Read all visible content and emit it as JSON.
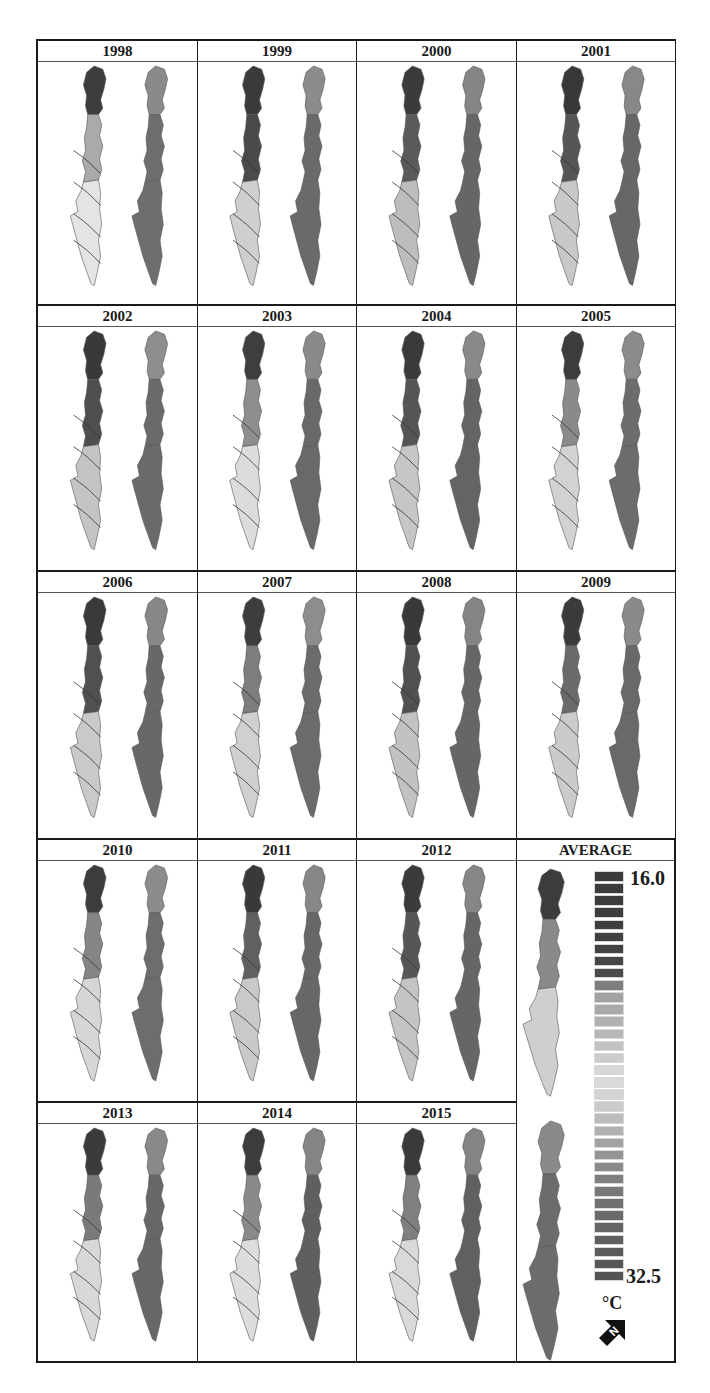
{
  "figure": {
    "panels": [
      {
        "label": "1998",
        "north": "#3d3d3d",
        "mid": "#aaaaaa",
        "south": "#e4e4e4",
        "right": "#6e6e6e",
        "rightTop": "#8a8a8a"
      },
      {
        "label": "1999",
        "north": "#3a3a3a",
        "mid": "#4a4a4a",
        "south": "#cfcfcf",
        "right": "#6a6a6a",
        "rightTop": "#8c8c8c"
      },
      {
        "label": "2000",
        "north": "#3b3b3b",
        "mid": "#5a5a5a",
        "south": "#bdbdbd",
        "right": "#666666",
        "rightTop": "#858585"
      },
      {
        "label": "2001",
        "north": "#383838",
        "mid": "#555555",
        "south": "#c8c8c8",
        "right": "#676767",
        "rightTop": "#888888"
      },
      {
        "label": "2002",
        "north": "#393939",
        "mid": "#4e4e4e",
        "south": "#c4c4c4",
        "right": "#6a6a6a",
        "rightTop": "#8e8e8e"
      },
      {
        "label": "2003",
        "north": "#3e3e3e",
        "mid": "#8e8e8e",
        "south": "#dcdcdc",
        "right": "#696969",
        "rightTop": "#8a8a8a"
      },
      {
        "label": "2004",
        "north": "#3a3a3a",
        "mid": "#555555",
        "south": "#c6c6c6",
        "right": "#646464",
        "rightTop": "#898989"
      },
      {
        "label": "2005",
        "north": "#3c3c3c",
        "mid": "#8a8a8a",
        "south": "#d2d2d2",
        "right": "#6c6c6c",
        "rightTop": "#8b8b8b"
      },
      {
        "label": "2006",
        "north": "#3a3a3a",
        "mid": "#505050",
        "south": "#c9c9c9",
        "right": "#686868",
        "rightTop": "#878787"
      },
      {
        "label": "2007",
        "north": "#3d3d3d",
        "mid": "#7d7d7d",
        "south": "#d0d0d0",
        "right": "#6b6b6b",
        "rightTop": "#8d8d8d"
      },
      {
        "label": "2008",
        "north": "#393939",
        "mid": "#505050",
        "south": "#c2c2c2",
        "right": "#666666",
        "rightTop": "#848484"
      },
      {
        "label": "2009",
        "north": "#3b3b3b",
        "mid": "#6a6a6a",
        "south": "#cbcbcb",
        "right": "#696969",
        "rightTop": "#8a8a8a"
      },
      {
        "label": "2010",
        "north": "#3c3c3c",
        "mid": "#858585",
        "south": "#d6d6d6",
        "right": "#6d6d6d",
        "rightTop": "#8c8c8c"
      },
      {
        "label": "2011",
        "north": "#393939",
        "mid": "#606060",
        "south": "#c9c9c9",
        "right": "#676767",
        "rightTop": "#878787"
      },
      {
        "label": "2012",
        "north": "#3a3a3a",
        "mid": "#565656",
        "south": "#c4c4c4",
        "right": "#666666",
        "rightTop": "#868686"
      },
      {
        "label": "2013",
        "north": "#3b3b3b",
        "mid": "#7a7a7a",
        "south": "#d8d8d8",
        "right": "#676767",
        "rightTop": "#898989"
      },
      {
        "label": "2014",
        "north": "#3c3c3c",
        "mid": "#8a8a8a",
        "south": "#dddddd",
        "right": "#5f5f5f",
        "rightTop": "#858585"
      },
      {
        "label": "2015",
        "north": "#3a3a3a",
        "mid": "#7f7f7f",
        "south": "#d9d9d9",
        "right": "#606060",
        "rightTop": "#848484"
      }
    ],
    "average": {
      "label": "AVERAGE",
      "north": "#3c3c3c",
      "mid": "#8a8a8a",
      "south": "#cfcfcf",
      "right": "#6c6c6c",
      "rightTop": "#8a8a8a"
    },
    "contour_labels": [
      "21",
      "22",
      "23",
      "24",
      "25",
      "26"
    ],
    "legend": {
      "min_label": "16.0",
      "max_label": "32.5",
      "unit": "°C",
      "north_arrow": "N",
      "swatches": [
        "#3a3a3a",
        "#3b3b3b",
        "#3c3c3c",
        "#3d3d3d",
        "#3e3e3e",
        "#404040",
        "#424242",
        "#454545",
        "#4a4a4a",
        "#7e7e7e",
        "#a2a2a2",
        "#a9a9a9",
        "#b0b0b0",
        "#b8b8b8",
        "#c2c2c2",
        "#cccccc",
        "#d6d6d6",
        "#d9d9d9",
        "#d4d4d4",
        "#cbcbcb",
        "#bcbcbc",
        "#b0b0b0",
        "#a2a2a2",
        "#959595",
        "#8a8a8a",
        "#7f7f7f",
        "#777777",
        "#707070",
        "#6a6a6a",
        "#656565",
        "#606060",
        "#5b5b5b",
        "#575757",
        "#545454"
      ]
    }
  }
}
